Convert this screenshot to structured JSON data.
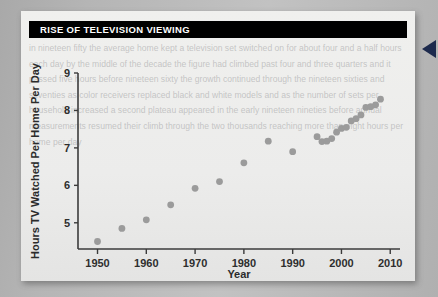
{
  "document": {
    "background_color": "#b5b5b5",
    "panel_color": "#ecebea",
    "ghost_body_text": "the television set became a fixture of the American living room during the postwar decade and its reach expanded steadily through the following half century as households added second and third receivers cable service arrived and recording devices extended the hours available for viewing the measurement services that track national audiences report the average number of hours a home keeps a set switched on each day and that figure has climbed almost without interruption from roughly four and a half hours in nineteen fifty to more than eight hours by the end of the two thousands analysts attribute the increase to a widening menu of channels longer broadcast days and the growing number of sets per household while a brief plateau in the early nineteen nineties coincided with the spread of competing leisure technologies the chart at the right plots the reported daily average for each measured year and shows the long upward trend",
    "panel_ghost_text": "in nineteen fifty the average home kept a television set switched on for about four and a half hours each day by the middle of the decade the figure had climbed past four and three quarters and it passed five hours before nineteen sixty the growth continued through the nineteen sixties and seventies as color receivers replaced black and white models and as the number of sets per household increased a second plateau appeared in the early nineteen nineties before annual measurements resumed their climb through the two thousands reaching more than eight hours per home per day"
  },
  "title_bar": {
    "title": "RISE OF TELEVISION VIEWING",
    "text_color": "#ffffff",
    "background_color": "#000000"
  },
  "edge_pointer": {
    "icon": "left-triangle-pointer-icon",
    "color": "#1d2a4d"
  },
  "chart_data": {
    "type": "scatter",
    "title": "RISE OF TELEVISION VIEWING",
    "xlabel": "Year",
    "ylabel": "Hours TV Watched Per Home Per Day",
    "xlim": [
      1946,
      2012
    ],
    "ylim": [
      4.3,
      9.0
    ],
    "xticks": [
      1950,
      1960,
      1970,
      1980,
      1990,
      2000,
      2010
    ],
    "yticks": [
      5,
      6,
      7,
      8,
      9
    ],
    "grid": false,
    "legend": null,
    "marker_color": "#9b9b9b",
    "x": [
      1950,
      1955,
      1960,
      1965,
      1970,
      1975,
      1980,
      1985,
      1990,
      1995,
      1996,
      1997,
      1998,
      1999,
      2000,
      2001,
      2002,
      2003,
      2004,
      2005,
      2006,
      2007,
      2008
    ],
    "values": [
      4.5,
      4.85,
      5.08,
      5.48,
      5.92,
      6.1,
      6.6,
      7.18,
      6.9,
      7.3,
      7.17,
      7.18,
      7.25,
      7.42,
      7.52,
      7.55,
      7.72,
      7.78,
      7.88,
      8.08,
      8.1,
      8.15,
      8.3
    ]
  }
}
